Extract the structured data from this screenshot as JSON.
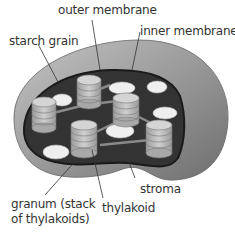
{
  "diagram": {
    "labels": {
      "outer_membrane": "outer membrane",
      "inner_membrane": "inner membrane",
      "starch_grain": "starch grain",
      "stroma": "stroma",
      "granum_line1": "granum (stack",
      "granum_line2": "of thylakoids)",
      "thylakoid": "thylakoid"
    },
    "colors": {
      "outer": "#8a8a8a",
      "inner_dark": "#2e2e2e",
      "granum": "#b8b8b8",
      "starch": "#efefef"
    }
  }
}
